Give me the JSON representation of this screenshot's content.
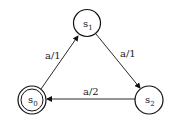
{
  "diagram": {
    "type": "finite-state-machine",
    "states": [
      {
        "id": "s0",
        "label": "s",
        "subscript": "0",
        "accepting": true,
        "cx": 32,
        "cy": 100
      },
      {
        "id": "s1",
        "label": "s",
        "subscript": "1",
        "accepting": false,
        "cx": 87,
        "cy": 23
      },
      {
        "id": "s2",
        "label": "s",
        "subscript": "2",
        "accepting": false,
        "cx": 149,
        "cy": 100
      }
    ],
    "transitions": [
      {
        "from": "s0",
        "to": "s1",
        "label": "a/1"
      },
      {
        "from": "s1",
        "to": "s2",
        "label": "a/1"
      },
      {
        "from": "s2",
        "to": "s0",
        "label": "a/2"
      }
    ],
    "colors": {
      "stroke": "#111111",
      "background": "#ffffff"
    }
  }
}
